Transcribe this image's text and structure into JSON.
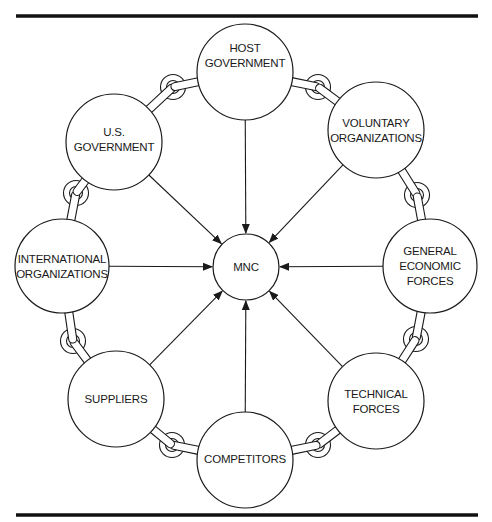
{
  "diagram": {
    "center": {
      "id": "mnc",
      "label": [
        "MNC"
      ]
    },
    "nodes": [
      {
        "id": "host-government",
        "label": [
          "HOST",
          "GOVERNMENT"
        ]
      },
      {
        "id": "voluntary-organizations",
        "label": [
          "VOLUNTARY",
          "ORGANIZATIONS"
        ]
      },
      {
        "id": "general-economic-forces",
        "label": [
          "GENERAL",
          "ECONOMIC",
          "FORCES"
        ]
      },
      {
        "id": "technical-forces",
        "label": [
          "TECHNICAL",
          "FORCES"
        ]
      },
      {
        "id": "competitors",
        "label": [
          "COMPETITORS"
        ]
      },
      {
        "id": "suppliers",
        "label": [
          "SUPPLIERS"
        ]
      },
      {
        "id": "international-organizations",
        "label": [
          "INTERNATIONAL",
          "ORGANIZATIONS"
        ]
      },
      {
        "id": "us-government",
        "label": [
          "U.S.",
          "GOVERNMENT"
        ]
      }
    ],
    "edges_to_center": [
      "host-government",
      "voluntary-organizations",
      "general-economic-forces",
      "technical-forces",
      "competitors",
      "suppliers",
      "international-organizations",
      "us-government"
    ],
    "chain_links": [
      [
        "host-government",
        "voluntary-organizations"
      ],
      [
        "voluntary-organizations",
        "general-economic-forces"
      ],
      [
        "general-economic-forces",
        "technical-forces"
      ],
      [
        "technical-forces",
        "competitors"
      ],
      [
        "competitors",
        "suppliers"
      ],
      [
        "suppliers",
        "international-organizations"
      ],
      [
        "international-organizations",
        "us-government"
      ],
      [
        "us-government",
        "host-government"
      ]
    ],
    "colors": {
      "line": "#1a1a1a",
      "background": "#ffffff"
    }
  }
}
